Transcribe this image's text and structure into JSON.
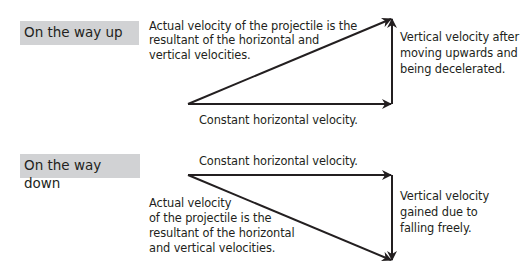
{
  "diagram": {
    "up": {
      "title": "On the way up",
      "resultant_label": [
        "Actual velocity of the projectile is the",
        "resultant of the horizontal and",
        "vertical velocities."
      ],
      "horizontal_label": "Constant horizontal velocity.",
      "vertical_label": [
        "Vertical velocity after",
        "moving upwards and",
        "being decelerated."
      ]
    },
    "down": {
      "title": "On the way down",
      "resultant_label": [
        "Actual velocity",
        "of the projectile is the",
        "resultant of the horizontal",
        "and vertical velocities."
      ],
      "horizontal_label": "Constant horizontal velocity.",
      "vertical_label": [
        "Vertical velocity",
        "gained due to",
        "falling freely."
      ]
    },
    "colors": {
      "label_bg": "#d1d2d4",
      "arrow": "#231f20",
      "text": "#231f20"
    }
  }
}
